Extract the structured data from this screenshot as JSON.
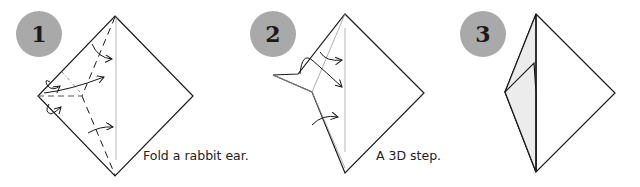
{
  "steps": [
    {
      "number": "1",
      "caption": "Fold a rabbit ear."
    },
    {
      "number": "2",
      "caption": "A 3D step."
    },
    {
      "number": "3",
      "caption": ""
    }
  ],
  "colors": {
    "badge": "#a9a9a9",
    "line": "#1a1a1a",
    "crease": "#b5b5b5",
    "flap_fill": "#ececec"
  }
}
